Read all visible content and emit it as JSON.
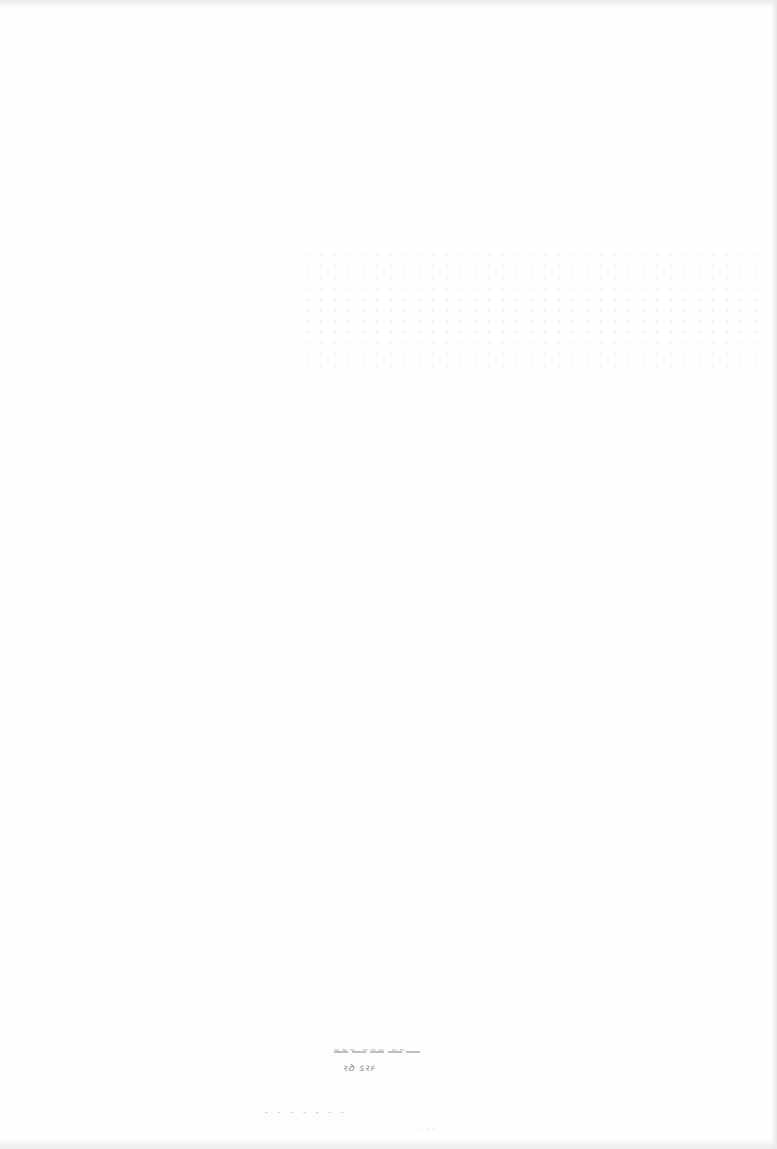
{
  "page": {
    "type": "scanned-blank-page",
    "background_color": "#fefefe"
  },
  "marks": {
    "bottom_center_line1": "~~~ ~~~ ~~",
    "bottom_center_line2": "ꝛꝺ ꜱꝛꜰ",
    "bottom_line3": "- - -   - - - -",
    "bottom_line4": "· · ·"
  }
}
